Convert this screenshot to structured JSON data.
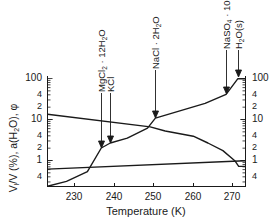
{
  "chart_data": {
    "type": "line",
    "title": "",
    "xlabel": "Temperature (K)",
    "ylabel_left": "V_l/V (%), a(H2O), φ",
    "ylabel_right": "",
    "xlim": [
      223,
      273
    ],
    "ylim": [
      0.23,
      100
    ],
    "yscale": "log",
    "grid": false,
    "x_ticks": [
      230,
      240,
      250,
      260,
      270
    ],
    "y_ticks_left": [
      "100",
      "4",
      "2",
      "10",
      "4",
      "2",
      "1",
      "4"
    ],
    "y_ticks_right": [
      "100",
      "4",
      "2",
      "10",
      "4",
      "2",
      "1",
      "4"
    ],
    "series": [
      {
        "name": "Liquid volume fraction V_l/V (%)",
        "x": [
          223.3,
          228.1,
          233.4,
          236.9,
          239.2,
          243.5,
          248.6,
          250.6,
          263.2,
          268.5,
          271.5,
          273.3
        ],
        "y": [
          0.23,
          0.3,
          0.52,
          1.96,
          2.6,
          3.4,
          6.0,
          10.5,
          24.0,
          40.0,
          96.0,
          96.0
        ]
      },
      {
        "name": "Water activity a(H2O)",
        "x": [
          223.3,
          249.3,
          253.1,
          260.2,
          263.9,
          267.7,
          270.7,
          271.7,
          273.3
        ],
        "y": [
          13.0,
          6.4,
          5.1,
          3.8,
          2.6,
          1.7,
          0.96,
          0.7,
          0.7
        ]
      },
      {
        "name": "φ",
        "x": [
          223.3,
          273.3
        ],
        "y": [
          0.6,
          0.96
        ]
      }
    ],
    "annotations": [
      {
        "label": "MgCl2 · 12H2O",
        "x": 236.9,
        "arrow_to_y": 1.96
      },
      {
        "label": "KCl",
        "x": 239.2,
        "arrow_to_y": 2.6
      },
      {
        "label": "NaCl · 2H2O",
        "x": 250.6,
        "arrow_to_y": 10.5
      },
      {
        "label": "NaSO4 · 10H2O",
        "x": 268.5,
        "arrow_to_y": 40.0
      },
      {
        "label": "H2O(s)",
        "x": 271.5,
        "arrow_to_y": 96.0
      }
    ]
  },
  "labels": {
    "xlabel": "Temperature (K)",
    "x_ticks": [
      "230",
      "240",
      "250",
      "260",
      "270"
    ],
    "left_ticks": [
      "100",
      "4",
      "2",
      "10",
      "4",
      "2",
      "1",
      "4"
    ],
    "right_ticks": [
      "100",
      "4",
      "2",
      "10",
      "4",
      "2",
      "1",
      "4"
    ],
    "ann_mgcl2": "MgCl",
    "ann_mgcl2_sub": "2",
    "ann_mgcl2_rest": " · 12H",
    "ann_mgcl2_sub2": "2",
    "ann_mgcl2_o": "O",
    "ann_kcl": "KCl",
    "ann_nacl": "NaCl · 2H",
    "ann_nacl_sub": "2",
    "ann_nacl_o": "O",
    "ann_naso4": "NaSO",
    "ann_naso4_sub": "4",
    "ann_naso4_rest": " · 10H",
    "ann_naso4_sub2": "2",
    "ann_naso4_o": "O",
    "ann_h2o": "H",
    "ann_h2o_sub": "2",
    "ann_h2o_rest": "O(s)",
    "ylabel_a": "V",
    "ylabel_sub1": "l",
    "ylabel_b": "/V (%), a(H",
    "ylabel_sub2": "2",
    "ylabel_c": "O), φ"
  },
  "colors": {
    "line": "#1a1a1a",
    "background": "#ffffff"
  }
}
